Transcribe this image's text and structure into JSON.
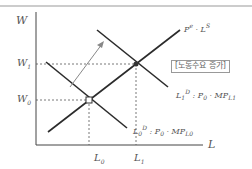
{
  "diagram": {
    "axes": {
      "y_label": "W",
      "x_label": "L"
    },
    "ticks": {
      "w1": {
        "base": "W",
        "sub": "1"
      },
      "w0": {
        "base": "W",
        "sub": "0"
      },
      "l0": {
        "base": "L",
        "sub": "0"
      },
      "l1": {
        "base": "L",
        "sub": "1"
      }
    },
    "curves": {
      "supply": {
        "text": "P",
        "sup": "e",
        "mid": " · L",
        "sup2": "S"
      },
      "demand1": {
        "base": "L",
        "sub": "1",
        "sup": "D",
        "rest": " : P",
        "rest_sub": "0",
        "rest2": " · MP",
        "rest2_sub": "L1"
      },
      "demand0": {
        "base": "L",
        "sub": "0",
        "sup": "D",
        "rest": " : P",
        "rest_sub": "0",
        "rest2": " · MP",
        "rest2_sub": "L0"
      }
    },
    "annotation": "[노동수요 증가]",
    "colors": {
      "curve": "#2b2b2b",
      "axis": "#444444",
      "arrow": "#888888",
      "dashed": "#555555",
      "top_rule": "#999999"
    }
  }
}
